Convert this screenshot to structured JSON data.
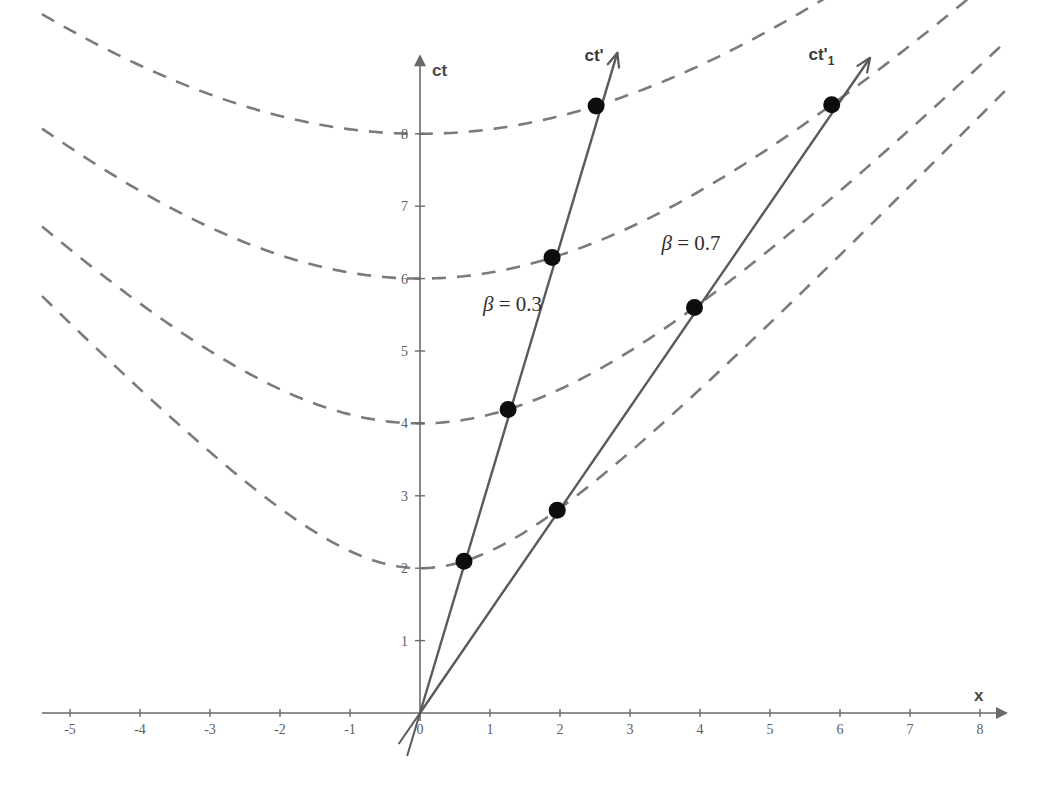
{
  "figure": {
    "kind": "minkowski-spacetime-diagram",
    "background_color": "#ffffff",
    "width": 1045,
    "height": 787
  },
  "axes": {
    "x_axis": {
      "label": "x",
      "ticks": [
        "-5",
        "-4",
        "-3",
        "-2",
        "-1",
        "0",
        "1",
        "2",
        "3",
        "4",
        "5",
        "6",
        "7",
        "8"
      ],
      "tick_values": [
        -5,
        -4,
        -3,
        -2,
        -1,
        0,
        1,
        2,
        3,
        4,
        5,
        6,
        7,
        8
      ],
      "range": [
        -5.4,
        8.4
      ],
      "arrow": true,
      "color": "#6a6a6a"
    },
    "y_axis": {
      "label": "ct",
      "ticks": [
        "1",
        "2",
        "3",
        "4",
        "5",
        "6",
        "7",
        "8"
      ],
      "tick_values": [
        1,
        2,
        3,
        4,
        5,
        6,
        7,
        8
      ],
      "range": [
        -0.9,
        9.1
      ],
      "arrow": true,
      "color": "#6a6a6a"
    },
    "origin_label": "0"
  },
  "chart_data": {
    "type": "line",
    "title": "",
    "xlabel": "x",
    "ylabel": "ct",
    "xlim": [
      -5.4,
      8.4
    ],
    "ylim": [
      -0.9,
      9.1
    ],
    "grid": false,
    "legend": "inline-annotations",
    "invariant_hyperbolas": {
      "equation": "ct^2 - x^2 = a^2",
      "style": "dashed",
      "color": "#7b7b7b",
      "a_values": [
        2,
        4,
        6,
        8
      ],
      "x_span": [
        -5.4,
        8.4
      ]
    },
    "series": [
      {
        "name": "ct'",
        "label": "ct'",
        "beta_label": "β = 0.3",
        "beta": 0.3,
        "slope_ct_per_x": 3.3333,
        "color": "#5a5a5a",
        "arrow_tip": {
          "x": 2.82,
          "ct": 9.12
        },
        "events": [
          {
            "a": 2,
            "x": 0.629,
            "ct": 2.097
          },
          {
            "a": 4,
            "x": 1.258,
            "ct": 4.193
          },
          {
            "a": 6,
            "x": 1.887,
            "ct": 6.29
          },
          {
            "a": 8,
            "x": 2.516,
            "ct": 8.386
          }
        ]
      },
      {
        "name": "ct'_1",
        "label": "ct'",
        "label_sub": "1",
        "beta_label": "β = 0.7",
        "beta": 0.7,
        "slope_ct_per_x": 1.4286,
        "color": "#5a5a5a",
        "arrow_tip": {
          "x": 6.43,
          "ct": 9.05
        },
        "events": [
          {
            "a": 2,
            "x": 1.96,
            "ct": 2.801
          },
          {
            "a": 4,
            "x": 3.921,
            "ct": 5.601
          },
          {
            "a": 6,
            "x": 5.881,
            "ct": 8.402
          }
        ]
      }
    ]
  },
  "annotations": [
    {
      "id": "beta-03",
      "text": "β = 0.3",
      "x": 0.9,
      "ct": 5.55
    },
    {
      "id": "beta-07",
      "text": "β = 0.7",
      "x": 3.45,
      "ct": 6.4
    },
    {
      "id": "ct-prime",
      "text": "ct'",
      "x": 2.35,
      "ct": 9.0
    },
    {
      "id": "ct-prime-1",
      "text": "ct'",
      "sub": "1",
      "x": 5.55,
      "ct": 9.02
    }
  ],
  "colors": {
    "axis": "#6a6a6a",
    "hyperbola": "#7b7b7b",
    "worldline": "#5a5a5a",
    "event_dot": "#0d0d0d",
    "text": "#3a3a3a",
    "background": "#ffffff"
  }
}
